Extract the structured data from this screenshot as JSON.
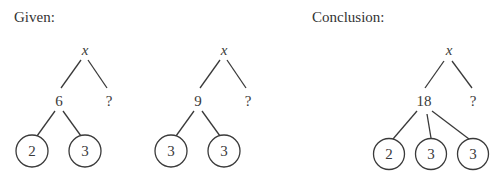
{
  "labels": {
    "given": "Given:",
    "conclusion": "Conclusion:"
  },
  "trees": [
    {
      "root": "x",
      "left": "6",
      "right": "?",
      "leaves": [
        "2",
        "3"
      ]
    },
    {
      "root": "x",
      "left": "9",
      "right": "?",
      "leaves": [
        "3",
        "3"
      ]
    },
    {
      "root": "x",
      "left": "18",
      "right": "?",
      "leaves": [
        "2",
        "3",
        "3"
      ]
    }
  ],
  "colors": {
    "ink": "#3a3a3a",
    "background": "#ffffff"
  }
}
